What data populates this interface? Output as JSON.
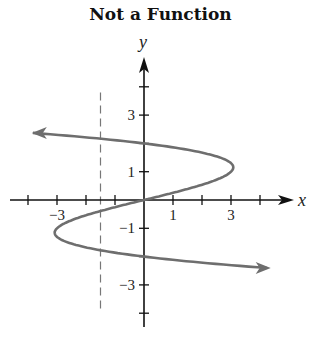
{
  "chart_data": {
    "type": "line",
    "title": "Not a Function",
    "xlabel": "x",
    "ylabel": "y",
    "xlim": [
      -4.6,
      5.0
    ],
    "ylim": [
      -4.5,
      5.0
    ],
    "grid": false,
    "x_ticks": [
      -4,
      -3,
      -2,
      -1,
      1,
      2,
      3,
      4
    ],
    "x_tick_labels": [
      {
        "value": -3,
        "label": "−3"
      },
      {
        "value": 1,
        "label": "1"
      },
      {
        "value": 3,
        "label": "3"
      }
    ],
    "y_ticks": [
      -4,
      -3,
      -2,
      -1,
      1,
      2,
      3,
      4
    ],
    "y_tick_labels": [
      {
        "value": 3,
        "label": "3"
      },
      {
        "value": 1,
        "label": "1"
      },
      {
        "value": -1,
        "label": "−1"
      },
      {
        "value": -3,
        "label": "−3"
      }
    ],
    "series": [
      {
        "name": "curve x = 4y − y³",
        "color": "#6e6e6e",
        "arrows_both_ends": true,
        "points": [
          {
            "x": -3.8,
            "y": 2.37
          },
          {
            "x": 0,
            "y": 2
          },
          {
            "x": 3.08,
            "y": 1.15
          },
          {
            "x": 0,
            "y": 0
          },
          {
            "x": -3.08,
            "y": -1.15
          },
          {
            "x": 0,
            "y": -2
          },
          {
            "x": 4.3,
            "y": -2.4
          }
        ]
      }
    ],
    "annotations": [
      {
        "type": "vertical-dashed-line",
        "x": -1.5,
        "y_range": [
          -4,
          3.8
        ],
        "color": "#777777"
      },
      {
        "type": "intersection-points",
        "points": [
          [
            -1.5,
            2.4
          ],
          [
            -1.5,
            -1.6
          ],
          [
            0,
            2
          ],
          [
            0,
            0
          ],
          [
            0,
            -2
          ]
        ]
      }
    ]
  },
  "labels": {
    "title": "Not a Function",
    "x_axis": "x",
    "y_axis": "y"
  }
}
